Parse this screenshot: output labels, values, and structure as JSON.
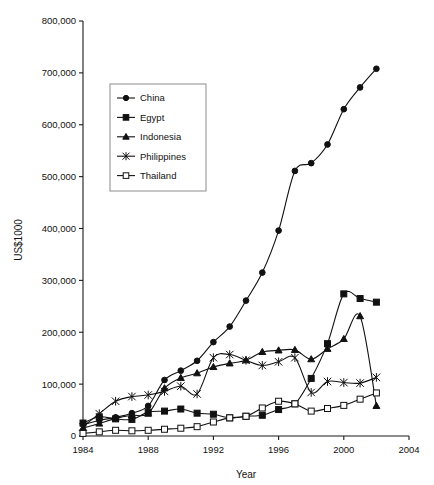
{
  "chart_data": {
    "type": "line",
    "title": "",
    "xlabel": "Year",
    "ylabel": "US$1000",
    "xlim": [
      1984,
      2004
    ],
    "ylim": [
      0,
      800000
    ],
    "xticks": [
      1984,
      1988,
      1992,
      1996,
      2000,
      2004
    ],
    "yticks": [
      0,
      100000,
      200000,
      300000,
      400000,
      500000,
      600000,
      700000,
      800000
    ],
    "ytick_labels": [
      "0",
      "100,000",
      "200,000",
      "300,000",
      "400,000",
      "500,000",
      "600,000",
      "700,000",
      "800,000"
    ],
    "xtick_labels": [
      "1984",
      "1988",
      "1992",
      "1996",
      "2000",
      "2004"
    ],
    "grid": false,
    "legend_position": "upper-left",
    "x": [
      1984,
      1985,
      1986,
      1987,
      1988,
      1989,
      1990,
      1991,
      1992,
      1993,
      1994,
      1995,
      1996,
      1997,
      1998,
      1999,
      2000,
      2001,
      2002
    ],
    "series": [
      {
        "name": "China",
        "marker": "filled-circle",
        "values": [
          22000,
          30000,
          36000,
          44000,
          58000,
          108000,
          126000,
          145000,
          181000,
          211000,
          261000,
          315000,
          396000,
          511000,
          526000,
          562000,
          630000,
          672000,
          708000
        ]
      },
      {
        "name": "Egypt",
        "marker": "filled-square",
        "values": [
          25000,
          37000,
          33000,
          32000,
          46000,
          48000,
          52000,
          44000,
          42000,
          35000,
          38000,
          40000,
          51000,
          62000,
          111000,
          178000,
          274000,
          265000,
          258000
        ]
      },
      {
        "name": "Indonesia",
        "marker": "filled-triangle",
        "values": [
          15000,
          24000,
          34000,
          40000,
          43000,
          92000,
          112000,
          121000,
          133000,
          140000,
          146000,
          162000,
          165000,
          166000,
          148000,
          168000,
          187000,
          231000,
          58000
        ]
      },
      {
        "name": "Philippines",
        "marker": "asterisk",
        "values": [
          18000,
          43000,
          67000,
          76000,
          79000,
          86000,
          96000,
          81000,
          151000,
          157000,
          146000,
          136000,
          143000,
          151000,
          84000,
          105000,
          103000,
          102000,
          113000
        ]
      },
      {
        "name": "Thailand",
        "marker": "open-square",
        "values": [
          5000,
          8000,
          11000,
          10000,
          11000,
          13000,
          15000,
          18000,
          27000,
          35000,
          38000,
          54000,
          67000,
          62000,
          48000,
          53000,
          59000,
          71000,
          83000
        ]
      }
    ]
  },
  "legend": {
    "entries": [
      {
        "label": "China"
      },
      {
        "label": "Egypt"
      },
      {
        "label": "Indonesia"
      },
      {
        "label": "Philippines"
      },
      {
        "label": "Thailand"
      }
    ]
  },
  "colors": {
    "ink": "#111111",
    "legend_border": "#8c8c8c",
    "background": "#ffffff"
  }
}
